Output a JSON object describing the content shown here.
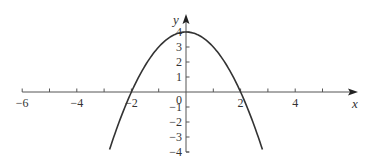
{
  "chart_data": {
    "type": "line",
    "title": "",
    "xlabel": "x",
    "ylabel": "y",
    "function": "y = 4 - x^2",
    "xlim": [
      -6,
      5.7
    ],
    "ylim": [
      -4,
      4.5
    ],
    "grid": false,
    "legend": null,
    "x_ticks": [
      -6,
      -5,
      -4,
      -3,
      -2,
      -1,
      1,
      2,
      3,
      4,
      5
    ],
    "x_tick_labels": [
      "-6",
      "-4",
      "-2",
      "2",
      "4"
    ],
    "x_tick_label_values": [
      -6,
      -4,
      -2,
      2,
      4
    ],
    "y_ticks": [
      -4,
      -3,
      -2,
      -1,
      1,
      2,
      3,
      4
    ],
    "y_tick_labels": [
      "4",
      "3",
      "2",
      "1",
      "-1",
      "-2",
      "-3",
      "-4"
    ],
    "y_tick_label_values": [
      4,
      3,
      2,
      1,
      -1,
      -2,
      -3,
      -4
    ],
    "origin_label": "0",
    "series": [
      {
        "name": "y = 4 - x^2",
        "x": [
          -2.8,
          -2.5,
          -2,
          -1.5,
          -1,
          -0.5,
          0,
          0.5,
          1,
          1.5,
          2,
          2.5,
          2.8
        ],
        "values": [
          -3.84,
          -2.25,
          0,
          1.75,
          3,
          3.75,
          4,
          3.75,
          3,
          1.75,
          0,
          -2.25,
          -3.84
        ]
      }
    ],
    "key_points": {
      "vertex": [
        0,
        4
      ],
      "x_intercepts": [
        -2,
        2
      ],
      "y_intercept": 4
    }
  },
  "colors": {
    "axis": "#555555",
    "curve": "#333333",
    "text": "#333333",
    "background": "#ffffff"
  }
}
